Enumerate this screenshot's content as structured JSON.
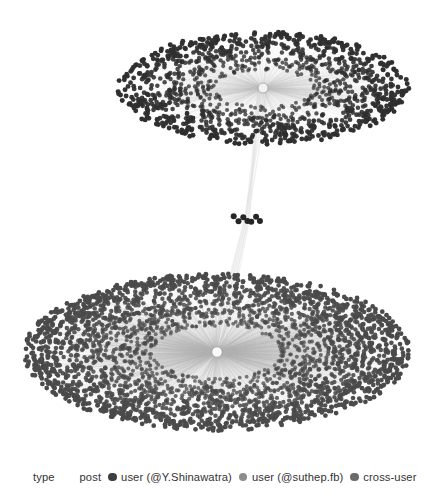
{
  "figure": {
    "title": "",
    "background_color": "#ffffff"
  },
  "legend": {
    "title": "type",
    "entries": [
      {
        "label": "post",
        "color": "#3a3a3a",
        "marker": "none"
      },
      {
        "label": "user (@Y.Shinawatra)",
        "color": "#3d3d3d",
        "marker": "circle"
      },
      {
        "label": "user (@suthep.fb)",
        "color": "#8c8c8c",
        "marker": "circle"
      },
      {
        "label": "cross-user",
        "color": "#6b6b6b",
        "marker": "circle"
      }
    ]
  },
  "chart_data": {
    "type": "scatter",
    "title": "",
    "xlabel": "",
    "ylabel": "",
    "grid": false,
    "legend_position": "bottom",
    "clusters": [
      {
        "name": "upper-cluster",
        "hub_label": "user (@Y.Shinawatra)",
        "center": {
          "x": 263,
          "y": 88
        },
        "radius_x": 145,
        "radius_y": 56,
        "node_count": 1250,
        "node_color": "#2f2f2f",
        "node_size": 2.2,
        "edge_color": "#bdbdbd",
        "hub_color": "#f2f2f2",
        "hub_radius": 5.0
      },
      {
        "name": "lower-cluster",
        "hub_label": "user (@suthep.fb)",
        "center": {
          "x": 217,
          "y": 352
        },
        "radius_x": 192,
        "radius_y": 78,
        "node_count": 3200,
        "node_color": "#4a4a4a",
        "node_size": 2.1,
        "edge_color": "#b4b4b4",
        "hub_color": "#fafafa",
        "hub_radius": 5.2
      },
      {
        "name": "mid-cross-user-cluster",
        "hub_label": "cross-user",
        "center": {
          "x": 247,
          "y": 219
        },
        "radius_x": 13,
        "radius_y": 3,
        "node_count": 7,
        "node_color": "#262626",
        "node_size": 3.0,
        "edge_color": "#d8d8d8",
        "hub_radius": 0
      }
    ],
    "bridge": {
      "from": "upper-cluster",
      "to": "lower-cluster",
      "via": "mid-cross-user-cluster",
      "edge_color": "#dcdcdc",
      "edge_count": 16
    }
  }
}
